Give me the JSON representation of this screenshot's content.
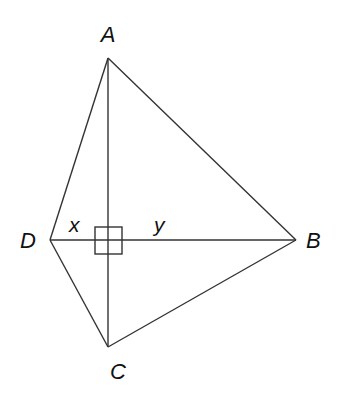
{
  "diagram": {
    "type": "quadrilateral with perpendicular diagonals",
    "vertices": {
      "A": {
        "label": "A",
        "x": 108,
        "y": 58
      },
      "B": {
        "label": "B",
        "x": 296,
        "y": 240
      },
      "C": {
        "label": "C",
        "x": 108,
        "y": 347
      },
      "D": {
        "label": "D",
        "x": 50,
        "y": 240
      }
    },
    "segment_labels": {
      "x": {
        "label": "x",
        "segment": "D to intersection"
      },
      "y": {
        "label": "y",
        "segment": "intersection to B"
      }
    },
    "right_angle_marker": true,
    "line_color": "#333333"
  }
}
